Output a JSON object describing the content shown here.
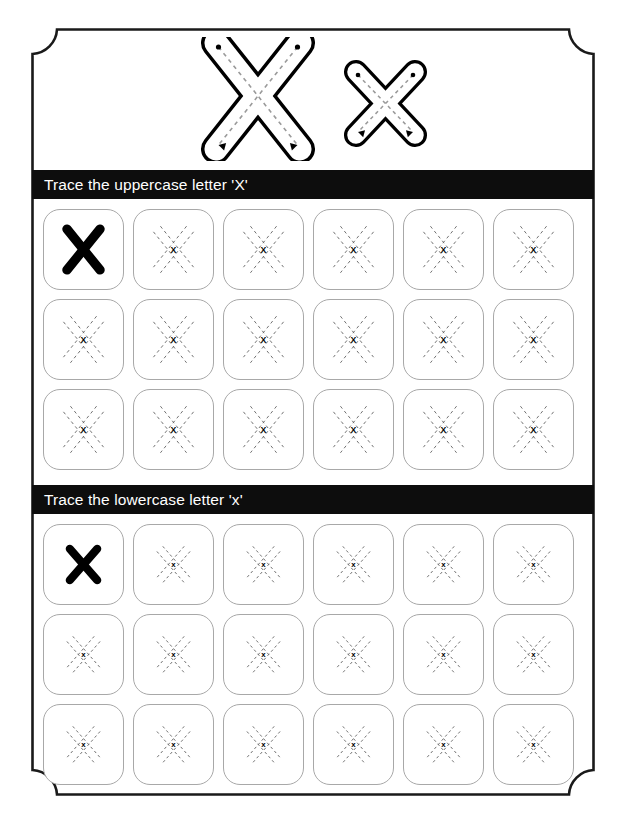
{
  "worksheet": {
    "letter_uppercase": "X",
    "letter_lowercase": "x",
    "hero": {
      "uppercase_glyph": "X",
      "lowercase_glyph": "x",
      "guide_style": "dashed-centerline-with-start-dot-and-arrowhead"
    },
    "sections": [
      {
        "id": "uppercase",
        "bar_label": "Trace the uppercase letter 'X'",
        "bar_background": "#0d0d0d",
        "bar_text_color": "#ffffff",
        "rows": 3,
        "columns": 6,
        "cells": [
          [
            {
              "kind": "solid",
              "glyph": "X"
            },
            {
              "kind": "dashed",
              "glyph": "X"
            },
            {
              "kind": "dashed",
              "glyph": "X"
            },
            {
              "kind": "dashed",
              "glyph": "X"
            },
            {
              "kind": "dashed",
              "glyph": "X"
            },
            {
              "kind": "dashed",
              "glyph": "X"
            }
          ],
          [
            {
              "kind": "dashed",
              "glyph": "X"
            },
            {
              "kind": "dashed",
              "glyph": "X"
            },
            {
              "kind": "dashed",
              "glyph": "X"
            },
            {
              "kind": "dashed",
              "glyph": "X"
            },
            {
              "kind": "dashed",
              "glyph": "X"
            },
            {
              "kind": "dashed",
              "glyph": "X"
            }
          ],
          [
            {
              "kind": "dashed",
              "glyph": "X"
            },
            {
              "kind": "dashed",
              "glyph": "X"
            },
            {
              "kind": "dashed",
              "glyph": "X"
            },
            {
              "kind": "dashed",
              "glyph": "X"
            },
            {
              "kind": "dashed",
              "glyph": "X"
            },
            {
              "kind": "dashed",
              "glyph": "X"
            }
          ]
        ]
      },
      {
        "id": "lowercase",
        "bar_label": "Trace the lowercase letter 'x'",
        "bar_background": "#0d0d0d",
        "bar_text_color": "#ffffff",
        "rows": 3,
        "columns": 6,
        "cells": [
          [
            {
              "kind": "solid",
              "glyph": "x"
            },
            {
              "kind": "dashed",
              "glyph": "x"
            },
            {
              "kind": "dashed",
              "glyph": "x"
            },
            {
              "kind": "dashed",
              "glyph": "x"
            },
            {
              "kind": "dashed",
              "glyph": "x"
            },
            {
              "kind": "dashed",
              "glyph": "x"
            }
          ],
          [
            {
              "kind": "dashed",
              "glyph": "x"
            },
            {
              "kind": "dashed",
              "glyph": "x"
            },
            {
              "kind": "dashed",
              "glyph": "x"
            },
            {
              "kind": "dashed",
              "glyph": "x"
            },
            {
              "kind": "dashed",
              "glyph": "x"
            },
            {
              "kind": "dashed",
              "glyph": "x"
            }
          ],
          [
            {
              "kind": "dashed",
              "glyph": "x"
            },
            {
              "kind": "dashed",
              "glyph": "x"
            },
            {
              "kind": "dashed",
              "glyph": "x"
            },
            {
              "kind": "dashed",
              "glyph": "x"
            },
            {
              "kind": "dashed",
              "glyph": "x"
            },
            {
              "kind": "dashed",
              "glyph": "x"
            }
          ]
        ]
      }
    ],
    "colors": {
      "page_background": "#ffffff",
      "frame_stroke": "#1a1a1a",
      "cell_border": "#a8a8a8",
      "letter_ink": "#000000",
      "guide_dash": "#9a9a9a"
    }
  }
}
